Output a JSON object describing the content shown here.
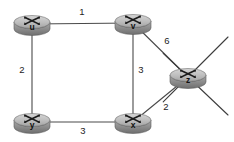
{
  "diagram": {
    "background_color": "#ffffff",
    "node_fill_color": "#b4b4b4",
    "node_stroke_color": "#5c5c5c",
    "edge_color": "#4a4a4a",
    "label_color": "#1d1d1d"
  },
  "chart_data": {
    "type": "diagram",
    "nodes": [
      {
        "id": "u",
        "label": "u",
        "x": 32,
        "y": 22,
        "icon": "router-icon"
      },
      {
        "id": "v",
        "label": "v",
        "x": 133,
        "y": 21,
        "icon": "router-icon"
      },
      {
        "id": "z",
        "label": "z",
        "x": 188,
        "y": 75,
        "icon": "router-icon"
      },
      {
        "id": "y",
        "label": "y",
        "x": 32,
        "y": 120,
        "icon": "router-icon"
      },
      {
        "id": "x",
        "label": "x",
        "x": 133,
        "y": 120,
        "icon": "router-icon"
      }
    ],
    "edges": [
      {
        "from": "u",
        "to": "v",
        "weight": "1",
        "label_x": 82,
        "label_y": 12
      },
      {
        "from": "u",
        "to": "y",
        "weight": "2",
        "label_x": 22,
        "label_y": 70
      },
      {
        "from": "v",
        "to": "x",
        "weight": "3",
        "label_x": 141,
        "label_y": 70
      },
      {
        "from": "v",
        "to": "z",
        "weight": "6",
        "label_x": 167,
        "label_y": 41
      },
      {
        "from": "x",
        "to": "z",
        "weight": "2",
        "label_x": 166,
        "label_y": 107
      },
      {
        "from": "y",
        "to": "x",
        "weight": "3",
        "label_x": 83,
        "label_y": 131
      }
    ],
    "stubs": [
      {
        "from": "z",
        "x2": 228,
        "y2": 37
      },
      {
        "from": "z",
        "x2": 228,
        "y2": 115
      }
    ]
  }
}
